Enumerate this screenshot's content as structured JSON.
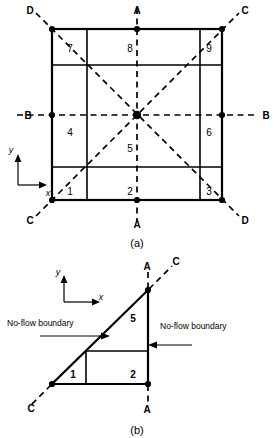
{
  "figure": {
    "panels": [
      {
        "id": "a",
        "caption": "(a)",
        "cell_numbers": [
          "7",
          "8",
          "9",
          "4",
          "5",
          "6",
          "1",
          "2",
          "3"
        ],
        "section_labels": [
          {
            "name": "D-top-left",
            "text": "D"
          },
          {
            "name": "A-top",
            "text": "A"
          },
          {
            "name": "C-top-right",
            "text": "C"
          },
          {
            "name": "B-left",
            "text": "B"
          },
          {
            "name": "B-right",
            "text": "B"
          },
          {
            "name": "C-bottom-left",
            "text": "C"
          },
          {
            "name": "A-bottom",
            "text": "A"
          },
          {
            "name": "D-bottom-right",
            "text": "D"
          }
        ],
        "axes": {
          "x": "x",
          "y": "y"
        }
      },
      {
        "id": "b",
        "caption": "(b)",
        "cell_numbers": [
          "5",
          "1",
          "2"
        ],
        "section_labels": [
          {
            "name": "A-top",
            "text": "A"
          },
          {
            "name": "C-top-right",
            "text": "C"
          },
          {
            "name": "C-bottom-left",
            "text": "C"
          },
          {
            "name": "A-bottom",
            "text": "A"
          }
        ],
        "axes": {
          "x": "x",
          "y": "y"
        },
        "annotations": [
          {
            "name": "no-flow-left",
            "text": "No-flow boundary"
          },
          {
            "name": "no-flow-right",
            "text": "No-flow boundary"
          }
        ]
      }
    ],
    "colors": {
      "line": "#000000",
      "background": "#ffffff"
    }
  }
}
